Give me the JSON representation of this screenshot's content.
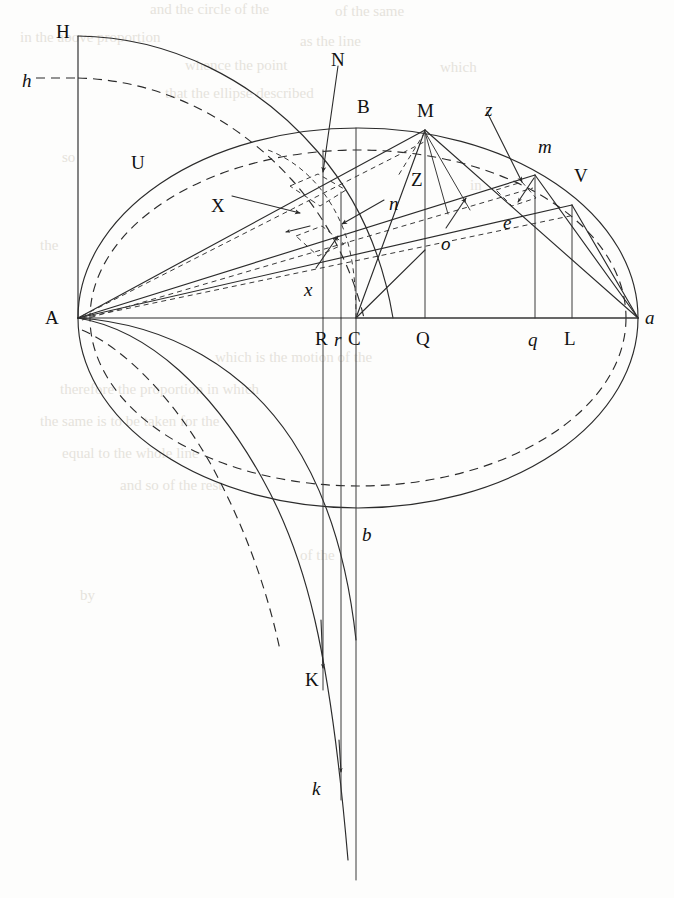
{
  "figure": {
    "kind": "geometric-construction",
    "background_color": "#fdfdfc",
    "ink_color": "#2b2b2b",
    "ghost_text_color": "#dedad2"
  },
  "labels": {
    "upright": [
      {
        "id": "H",
        "text": "H",
        "x": 56,
        "y": 22
      },
      {
        "id": "N",
        "text": "N",
        "x": 331,
        "y": 50
      },
      {
        "id": "B",
        "text": "B",
        "x": 357,
        "y": 97
      },
      {
        "id": "M",
        "text": "M",
        "x": 417,
        "y": 101
      },
      {
        "id": "U",
        "text": "U",
        "x": 131,
        "y": 153
      },
      {
        "id": "V",
        "text": "V",
        "x": 574,
        "y": 166
      },
      {
        "id": "Z",
        "text": "Z",
        "x": 411,
        "y": 170
      },
      {
        "id": "X",
        "text": "X",
        "x": 211,
        "y": 196
      },
      {
        "id": "A",
        "text": "A",
        "x": 45,
        "y": 308
      },
      {
        "id": "R",
        "text": "R",
        "x": 315,
        "y": 329
      },
      {
        "id": "C",
        "text": "C",
        "x": 348,
        "y": 329
      },
      {
        "id": "Q",
        "text": "Q",
        "x": 416,
        "y": 329
      },
      {
        "id": "L",
        "text": "L",
        "x": 564,
        "y": 329
      },
      {
        "id": "K",
        "text": "K",
        "x": 305,
        "y": 670
      }
    ],
    "italic": [
      {
        "id": "h",
        "text": "h",
        "x": 22,
        "y": 71
      },
      {
        "id": "z",
        "text": "z",
        "x": 485,
        "y": 100
      },
      {
        "id": "m",
        "text": "m",
        "x": 538,
        "y": 137
      },
      {
        "id": "n",
        "text": "n",
        "x": 389,
        "y": 194
      },
      {
        "id": "e",
        "text": "e",
        "x": 503,
        "y": 213
      },
      {
        "id": "o",
        "text": "o",
        "x": 441,
        "y": 234
      },
      {
        "id": "x",
        "text": "x",
        "x": 304,
        "y": 280
      },
      {
        "id": "r",
        "text": "r",
        "x": 334,
        "y": 330
      },
      {
        "id": "q",
        "text": "q",
        "x": 528,
        "y": 330
      },
      {
        "id": "a",
        "text": "a",
        "x": 645,
        "y": 308
      },
      {
        "id": "b",
        "text": "b",
        "x": 362,
        "y": 525
      },
      {
        "id": "k",
        "text": "k",
        "x": 312,
        "y": 779
      }
    ]
  },
  "geometry": {
    "major_axis": {
      "left_point": "A",
      "right_point": "a",
      "ax": 78,
      "ay": 318,
      "bx": 638,
      "by": 318
    },
    "ellipse_outer": {
      "cx": 358,
      "cy": 318,
      "rx": 280,
      "ry": 190
    },
    "ellipse_inner_dashed": {
      "cx": 358,
      "cy": 318,
      "rx": 268,
      "ry": 168
    },
    "ordinates": [
      {
        "label": "R",
        "x": 323
      },
      {
        "label": "r",
        "x": 341
      },
      {
        "label": "C",
        "x": 356
      },
      {
        "label": "Q",
        "x": 425
      },
      {
        "label": "q",
        "x": 535
      },
      {
        "label": "L",
        "x": 572
      }
    ],
    "points": {
      "A": [
        78,
        318
      ],
      "a": [
        638,
        318
      ],
      "B": [
        363,
        128
      ],
      "M": [
        425,
        130
      ],
      "m": [
        535,
        175
      ],
      "V": [
        572,
        205
      ],
      "e": [
        510,
        232
      ],
      "C": [
        356,
        318
      ],
      "Q": [
        425,
        318
      ],
      "q": [
        535,
        318
      ],
      "L": [
        572,
        318
      ],
      "R": [
        323,
        318
      ],
      "r": [
        341,
        318
      ],
      "b": [
        356,
        508
      ],
      "H": [
        78,
        36
      ],
      "h": [
        78,
        78
      ]
    }
  },
  "ghost_text": {
    "note": "faint bleed-through of printed text from the reverse of the page",
    "lines": [
      {
        "x": 150,
        "y": 14,
        "text": "and  the  circle  of  the"
      },
      {
        "x": 330,
        "y": 16,
        "text": "of   the   same"
      },
      {
        "x": 20,
        "y": 40,
        "text": "in   the   above   proportion"
      },
      {
        "x": 300,
        "y": 44,
        "text": "as   the   line"
      },
      {
        "x": 180,
        "y": 68,
        "text": "whence   the   point"
      },
      {
        "x": 430,
        "y": 70,
        "text": "which"
      },
      {
        "x": 160,
        "y": 96,
        "text": "that   the   ellipse   described"
      },
      {
        "x": 60,
        "y": 160,
        "text": "so"
      },
      {
        "x": 470,
        "y": 188,
        "text": "in"
      },
      {
        "x": 40,
        "y": 248,
        "text": "the"
      },
      {
        "x": 210,
        "y": 360,
        "text": "which   is   the   motion   of   the"
      },
      {
        "x": 60,
        "y": 392,
        "text": "therefore   the   proportion   in   which"
      },
      {
        "x": 40,
        "y": 424,
        "text": "the   same   is   to   be   taken   for   the"
      },
      {
        "x": 60,
        "y": 456,
        "text": "equal   to   the   whole   line"
      },
      {
        "x": 120,
        "y": 488,
        "text": "and   so   of   the   rest"
      }
    ]
  }
}
